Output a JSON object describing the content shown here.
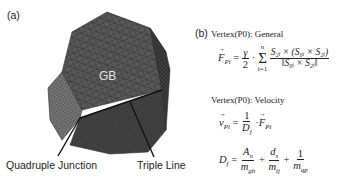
{
  "figure": {
    "panel_a": {
      "label": "(a)",
      "region_label": "GB",
      "callouts": {
        "quadruple_junction": "Quadruple Junction",
        "triple_line": "Triple Line"
      },
      "colors": {
        "mesh_dark": "#3a3a3a",
        "mesh_mid": "#555555",
        "mesh_light": "#777777",
        "line": "#111111",
        "gb_text": "#e6e6e6"
      }
    },
    "panel_b": {
      "label": "(b)",
      "heading_general": "Vertex(P0): General",
      "heading_velocity": "Vertex(P0): Velocity",
      "eq_force": {
        "lhs": "F",
        "lhs_sub": "Pi",
        "coef_num": "γ",
        "coef_den": "2",
        "sum_top": "n",
        "sum_bottom": "i=1",
        "numerator": "S₂ᵢ × (S₀ᵢ × S₂ᵢ)",
        "denominator": "‖S₀ᵢ × S₂ᵢ‖"
      },
      "eq_velocity": {
        "lhs": "v",
        "lhs_sub": "Pi",
        "num": "1",
        "den": "D",
        "den_sub": "f",
        "rhs": "F",
        "rhs_sub": "Pi"
      },
      "eq_drag": {
        "lhs": "D",
        "lhs_sub": "f",
        "t1_num": "A",
        "t1_num_sub": "n",
        "t1_den": "m",
        "t1_den_sub": "gb",
        "t2_num": "d",
        "t2_num_sub": "s",
        "t2_den": "m",
        "t2_den_sub": "tj",
        "t3_num": "1",
        "t3_den": "m",
        "t3_den_sub": "qp"
      }
    }
  }
}
